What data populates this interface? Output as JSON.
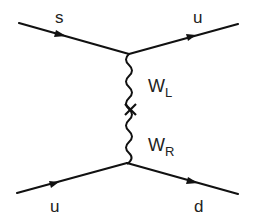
{
  "diagram": {
    "type": "feynman",
    "particles": {
      "top_in": "s",
      "top_out": "u",
      "bottom_in": "u",
      "bottom_out": "d"
    },
    "propagator": {
      "upper_label": "W",
      "upper_sub": "L",
      "lower_label": "W",
      "lower_sub": "R",
      "mixing_marker": "cross"
    },
    "colors": {
      "line": "#111111",
      "text": "#222222"
    }
  }
}
